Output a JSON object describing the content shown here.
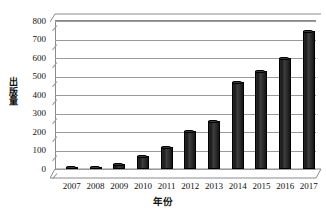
{
  "chart_data": {
    "type": "bar",
    "title": "",
    "xlabel": "年份",
    "ylabel": "出版量",
    "categories": [
      "2007",
      "2008",
      "2009",
      "2010",
      "2011",
      "2012",
      "2013",
      "2014",
      "2015",
      "2016",
      "2017"
    ],
    "values": [
      10,
      12,
      28,
      70,
      120,
      205,
      258,
      468,
      530,
      600,
      745
    ],
    "ylim": [
      0,
      800
    ],
    "ytick_labels": [
      "0",
      "100",
      "200",
      "300",
      "400",
      "500",
      "600",
      "700",
      "800"
    ],
    "ytick_values": [
      0,
      100,
      200,
      300,
      400,
      500,
      600,
      700,
      800
    ],
    "grid": true,
    "legend": null,
    "series": [
      {
        "name": "出版量",
        "values": [
          10,
          12,
          28,
          70,
          120,
          205,
          258,
          468,
          530,
          600,
          745
        ]
      }
    ],
    "style": {
      "bar_color": "#1f1f1f",
      "grid_color": "#9a9a9a",
      "axis_color": "#8a8a8a",
      "text_color": "#111111",
      "background": "#ffffff",
      "three_d": true
    }
  },
  "axis": {
    "y_title": "出版量",
    "x_title": "年份"
  },
  "caption": {
    "text": ""
  }
}
